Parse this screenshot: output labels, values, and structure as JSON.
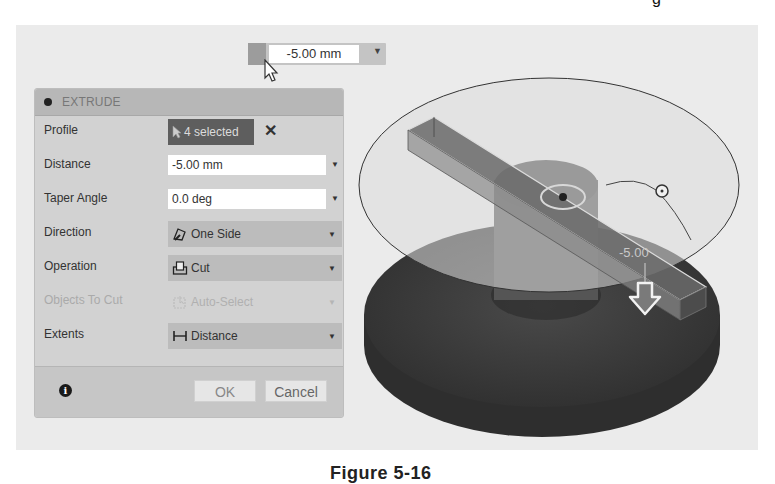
{
  "figure": {
    "caption": "Figure 5-16",
    "top_glyph": "g"
  },
  "floating_input": {
    "value": "-5.00 mm",
    "caret": "▼"
  },
  "dialog": {
    "title": "EXTRUDE",
    "rows": {
      "profile": {
        "label": "Profile",
        "value": "4 selected",
        "clear": "✕"
      },
      "distance": {
        "label": "Distance",
        "value": "-5.00 mm"
      },
      "taper_angle": {
        "label": "Taper Angle",
        "value": "0.0 deg"
      },
      "direction": {
        "label": "Direction",
        "value": "One Side",
        "icon": "one-side-icon"
      },
      "operation": {
        "label": "Operation",
        "value": "Cut",
        "icon": "cut-icon"
      },
      "objects_to_cut": {
        "label": "Objects To Cut",
        "value": "Auto-Select",
        "icon": "auto-select-icon",
        "enabled": false
      },
      "extents": {
        "label": "Extents",
        "value": "Distance",
        "icon": "distance-extent-icon"
      }
    },
    "footer": {
      "info": "i",
      "ok_label": "OK",
      "cancel_label": "Cancel"
    }
  },
  "viewport": {
    "dimension_label": "-5.00"
  },
  "colors": {
    "viewport_bg": "#ebebeb",
    "dialog_bg": "#d2d2d2",
    "selected_bg": "#5e5e5e",
    "dropdown_bg": "#bcbcbc",
    "model_dark": "#3f3f3f"
  }
}
